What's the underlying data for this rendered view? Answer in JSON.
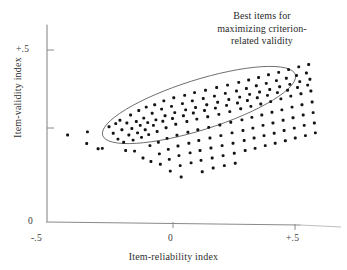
{
  "figure": {
    "background_color": "#ffffff",
    "ink_color": "#141414",
    "axis_color": "#8a8a8a",
    "ellipse_color": "#6d6d6d"
  },
  "annotation": {
    "line1": "Best items for",
    "line2": "maximizing criterion-",
    "line3": "related validity"
  },
  "chart_data": {
    "type": "scatter",
    "title": "",
    "xlabel": "Item-reliability index",
    "ylabel": "Item-validity index",
    "xlim": [
      -0.5,
      0.65
    ],
    "ylim": [
      0.0,
      0.62
    ],
    "xticks": [
      -0.5,
      0.0,
      0.5
    ],
    "xticklabels": [
      "-.5",
      "0",
      "+.5"
    ],
    "yticks": [
      0.0,
      0.25,
      0.5
    ],
    "yticklabels": [
      "0",
      "",
      "+.5"
    ],
    "grid": false,
    "legend": null,
    "annotations": [
      {
        "text": "Best items for maximizing criterion-related validity",
        "type": "region-callout",
        "shape": "ellipse",
        "ellipse": {
          "center_x": 0.115,
          "center_y": 0.325,
          "semi_major": 0.44,
          "semi_minor": 0.082,
          "rotation_deg": -17.5
        }
      }
    ],
    "points": [
      [
        -0.425,
        0.253
      ],
      [
        -0.345,
        0.262
      ],
      [
        -0.348,
        0.228
      ],
      [
        -0.302,
        0.213
      ],
      [
        -0.285,
        0.214
      ],
      [
        -0.258,
        0.277
      ],
      [
        -0.241,
        0.258
      ],
      [
        -0.231,
        0.286
      ],
      [
        -0.222,
        0.241
      ],
      [
        -0.214,
        0.296
      ],
      [
        -0.206,
        0.268
      ],
      [
        -0.199,
        0.232
      ],
      [
        -0.191,
        0.208
      ],
      [
        -0.186,
        0.288
      ],
      [
        -0.178,
        0.253
      ],
      [
        -0.171,
        0.311
      ],
      [
        -0.166,
        0.272
      ],
      [
        -0.161,
        0.238
      ],
      [
        -0.155,
        0.206
      ],
      [
        -0.148,
        0.292
      ],
      [
        -0.143,
        0.259
      ],
      [
        -0.138,
        0.324
      ],
      [
        -0.132,
        0.281
      ],
      [
        -0.127,
        0.246
      ],
      [
        -0.121,
        0.186
      ],
      [
        -0.118,
        0.302
      ],
      [
        -0.112,
        0.268
      ],
      [
        -0.108,
        0.334
      ],
      [
        -0.102,
        0.289
      ],
      [
        -0.098,
        0.254
      ],
      [
        -0.093,
        0.222
      ],
      [
        -0.089,
        0.176
      ],
      [
        -0.084,
        0.316
      ],
      [
        -0.079,
        0.281
      ],
      [
        -0.074,
        0.341
      ],
      [
        -0.069,
        0.297
      ],
      [
        -0.064,
        0.263
      ],
      [
        -0.059,
        0.232
      ],
      [
        -0.055,
        0.198
      ],
      [
        -0.051,
        0.168
      ],
      [
        -0.046,
        0.328
      ],
      [
        -0.041,
        0.293
      ],
      [
        -0.037,
        0.352
      ],
      [
        -0.032,
        0.309
      ],
      [
        -0.028,
        0.274
      ],
      [
        -0.024,
        0.243
      ],
      [
        -0.019,
        0.211
      ],
      [
        -0.015,
        0.182
      ],
      [
        -0.011,
        0.148
      ],
      [
        -0.006,
        0.336
      ],
      [
        -0.002,
        0.301
      ],
      [
        0.003,
        0.361
      ],
      [
        0.007,
        0.318
      ],
      [
        0.011,
        0.284
      ],
      [
        0.016,
        0.252
      ],
      [
        0.02,
        0.221
      ],
      [
        0.024,
        0.193
      ],
      [
        0.029,
        0.164
      ],
      [
        0.033,
        0.131
      ],
      [
        0.038,
        0.344
      ],
      [
        0.042,
        0.309
      ],
      [
        0.047,
        0.368
      ],
      [
        0.051,
        0.326
      ],
      [
        0.056,
        0.292
      ],
      [
        0.06,
        0.261
      ],
      [
        0.064,
        0.229
      ],
      [
        0.069,
        0.201
      ],
      [
        0.073,
        0.172
      ],
      [
        0.078,
        0.352
      ],
      [
        0.082,
        0.317
      ],
      [
        0.087,
        0.376
      ],
      [
        0.091,
        0.333
      ],
      [
        0.096,
        0.299
      ],
      [
        0.1,
        0.268
      ],
      [
        0.104,
        0.237
      ],
      [
        0.109,
        0.208
      ],
      [
        0.113,
        0.179
      ],
      [
        0.118,
        0.146
      ],
      [
        0.122,
        0.359
      ],
      [
        0.127,
        0.324
      ],
      [
        0.131,
        0.383
      ],
      [
        0.136,
        0.341
      ],
      [
        0.14,
        0.306
      ],
      [
        0.144,
        0.275
      ],
      [
        0.149,
        0.244
      ],
      [
        0.153,
        0.215
      ],
      [
        0.158,
        0.186
      ],
      [
        0.162,
        0.157
      ],
      [
        0.167,
        0.366
      ],
      [
        0.171,
        0.331
      ],
      [
        0.176,
        0.391
      ],
      [
        0.18,
        0.348
      ],
      [
        0.185,
        0.313
      ],
      [
        0.189,
        0.282
      ],
      [
        0.193,
        0.251
      ],
      [
        0.198,
        0.222
      ],
      [
        0.202,
        0.193
      ],
      [
        0.207,
        0.164
      ],
      [
        0.211,
        0.374
      ],
      [
        0.216,
        0.339
      ],
      [
        0.22,
        0.398
      ],
      [
        0.225,
        0.356
      ],
      [
        0.229,
        0.321
      ],
      [
        0.233,
        0.29
      ],
      [
        0.238,
        0.259
      ],
      [
        0.242,
        0.229
      ],
      [
        0.247,
        0.2
      ],
      [
        0.251,
        0.171
      ],
      [
        0.256,
        0.381
      ],
      [
        0.26,
        0.346
      ],
      [
        0.265,
        0.406
      ],
      [
        0.269,
        0.363
      ],
      [
        0.273,
        0.329
      ],
      [
        0.278,
        0.297
      ],
      [
        0.282,
        0.266
      ],
      [
        0.287,
        0.237
      ],
      [
        0.291,
        0.208
      ],
      [
        0.296,
        0.388
      ],
      [
        0.3,
        0.353
      ],
      [
        0.305,
        0.413
      ],
      [
        0.309,
        0.371
      ],
      [
        0.314,
        0.336
      ],
      [
        0.318,
        0.304
      ],
      [
        0.322,
        0.273
      ],
      [
        0.327,
        0.244
      ],
      [
        0.331,
        0.214
      ],
      [
        0.336,
        0.396
      ],
      [
        0.34,
        0.361
      ],
      [
        0.345,
        0.42
      ],
      [
        0.349,
        0.378
      ],
      [
        0.354,
        0.343
      ],
      [
        0.358,
        0.311
      ],
      [
        0.363,
        0.281
      ],
      [
        0.367,
        0.251
      ],
      [
        0.372,
        0.222
      ],
      [
        0.376,
        0.403
      ],
      [
        0.381,
        0.368
      ],
      [
        0.385,
        0.428
      ],
      [
        0.39,
        0.385
      ],
      [
        0.394,
        0.35
      ],
      [
        0.399,
        0.319
      ],
      [
        0.403,
        0.288
      ],
      [
        0.408,
        0.258
      ],
      [
        0.412,
        0.229
      ],
      [
        0.417,
        0.411
      ],
      [
        0.421,
        0.376
      ],
      [
        0.426,
        0.435
      ],
      [
        0.43,
        0.393
      ],
      [
        0.435,
        0.358
      ],
      [
        0.439,
        0.326
      ],
      [
        0.444,
        0.296
      ],
      [
        0.448,
        0.266
      ],
      [
        0.453,
        0.236
      ],
      [
        0.457,
        0.418
      ],
      [
        0.462,
        0.383
      ],
      [
        0.466,
        0.443
      ],
      [
        0.471,
        0.4
      ],
      [
        0.475,
        0.366
      ],
      [
        0.48,
        0.334
      ],
      [
        0.484,
        0.303
      ],
      [
        0.489,
        0.273
      ],
      [
        0.493,
        0.244
      ],
      [
        0.498,
        0.426
      ],
      [
        0.502,
        0.391
      ],
      [
        0.507,
        0.451
      ],
      [
        0.511,
        0.408
      ],
      [
        0.516,
        0.373
      ],
      [
        0.52,
        0.341
      ],
      [
        0.525,
        0.311
      ],
      [
        0.529,
        0.281
      ],
      [
        0.534,
        0.251
      ],
      [
        0.538,
        0.433
      ],
      [
        0.543,
        0.398
      ],
      [
        0.547,
        0.458
      ],
      [
        0.552,
        0.415
      ],
      [
        0.556,
        0.381
      ],
      [
        0.561,
        0.349
      ],
      [
        0.565,
        0.318
      ],
      [
        0.57,
        0.288
      ],
      [
        0.574,
        0.259
      ]
    ]
  }
}
